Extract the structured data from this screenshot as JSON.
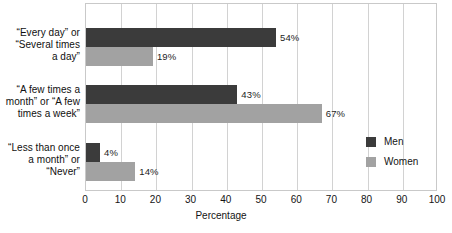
{
  "chart_data": {
    "type": "bar",
    "orientation": "horizontal",
    "title": "",
    "xlabel": "Percentage",
    "ylabel": "",
    "xlim": [
      0,
      100
    ],
    "xticks": [
      0,
      10,
      20,
      30,
      40,
      50,
      60,
      70,
      80,
      90,
      100
    ],
    "xtick_labels": [
      "0",
      "10",
      "20",
      "30",
      "40",
      "50",
      "60",
      "70",
      "80",
      "90",
      "100"
    ],
    "grid": "vertical",
    "legend_position": "right",
    "categories": [
      "“Every day” or\n“Several times\na day”",
      "“A few times a\nmonth” or “A few\ntimes a week”",
      "“Less than once\na month” or\n“Never”"
    ],
    "series": [
      {
        "name": "Men",
        "color": "#3b3b3b",
        "values": [
          54,
          43,
          4
        ],
        "value_labels": [
          "54%",
          "43%",
          "4%"
        ]
      },
      {
        "name": "Women",
        "color": "#a2a2a2",
        "values": [
          19,
          67,
          14
        ],
        "value_labels": [
          "19%",
          "67%",
          "14%"
        ]
      }
    ]
  },
  "legend": {
    "items": [
      {
        "label": "Men",
        "color": "#3b3b3b"
      },
      {
        "label": "Women",
        "color": "#a2a2a2"
      }
    ]
  },
  "axis": {
    "x_title": "Percentage"
  }
}
